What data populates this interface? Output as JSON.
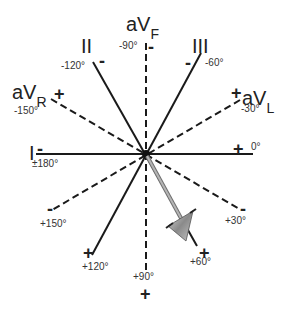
{
  "diagram": {
    "leads": [
      {
        "name": "I",
        "type": "limb",
        "style": "solid",
        "positive_angle": "0°",
        "negative_angle": "±180°"
      },
      {
        "name": "II",
        "type": "limb",
        "style": "solid",
        "positive_angle": "+60°",
        "negative_angle": "-120°"
      },
      {
        "name": "III",
        "type": "limb",
        "style": "solid",
        "positive_angle": "+120°",
        "negative_angle": "-60°"
      },
      {
        "name": "aVR",
        "type": "augmented",
        "style": "dashed",
        "positive_angle": "-150°",
        "negative_angle": "+30°"
      },
      {
        "name": "aVL",
        "type": "augmented",
        "style": "dashed",
        "positive_angle": "-30°",
        "negative_angle": "+150°"
      },
      {
        "name": "aVF",
        "type": "augmented",
        "style": "dashed",
        "positive_angle": "+90°",
        "negative_angle": "-90°"
      }
    ],
    "lead_labels": {
      "I": "I",
      "II": "II",
      "III": "III",
      "aVR_main": "aV",
      "aVR_sub": "R",
      "aVL_main": "aV",
      "aVL_sub": "L",
      "aVF_main": "aV",
      "aVF_sub": "F"
    },
    "angle_labels": {
      "a0": "0°",
      "a180": "±180°",
      "am30": "-30°",
      "am60": "-60°",
      "am90": "-90°",
      "am120": "-120°",
      "am150": "-150°",
      "ap30": "+30°",
      "ap60": "+60°",
      "ap90": "+90°",
      "ap120": "+120°",
      "ap150": "+150°"
    },
    "signs": {
      "plus": "+",
      "minus": "-"
    },
    "axis_vector": {
      "label": "Mean electrical axis",
      "angle": "+60°",
      "color": "#9a9a9a"
    },
    "colors": {
      "lines": "#1a1a1a",
      "arrow": "#9a9a9a",
      "background": "#ffffff"
    }
  }
}
